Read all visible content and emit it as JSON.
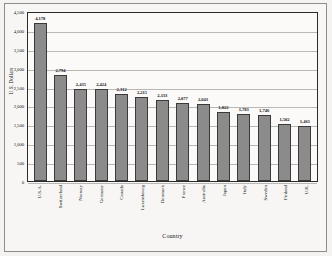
{
  "chart_data": {
    "type": "bar",
    "title": "",
    "xlabel": "Country",
    "ylabel": "U.S. Dollars",
    "ylim": [
      0,
      4500
    ],
    "ytick_step": 500,
    "grid": true,
    "legend": false,
    "bar_color": "#8b8b8b",
    "bar_border_color": "#3a3a3a",
    "yticks": [
      "4,500",
      "4,000",
      "3,500",
      "3,000",
      "2,500",
      "2,000",
      "1,500",
      "1,000",
      "500",
      "0"
    ],
    "categories": [
      "U.S.A.",
      "Switzerland",
      "Norway",
      "Germany",
      "Canada",
      "Luxembourg",
      "Denmark",
      "France",
      "Australia",
      "Japan",
      "Italy",
      "Sweden",
      "Finland",
      "U.K."
    ],
    "values": [
      4178,
      2794,
      2435,
      2424,
      2312,
      2215,
      2133,
      2077,
      2043,
      1822,
      1783,
      1746,
      1502,
      1461
    ],
    "value_labels": [
      "4,178",
      "2,794",
      "2,435",
      "2,424",
      "2,312",
      "2,215",
      "2,133",
      "2,077",
      "2,043",
      "1,822",
      "1,783",
      "1,746",
      "1,502",
      "1,461"
    ]
  }
}
